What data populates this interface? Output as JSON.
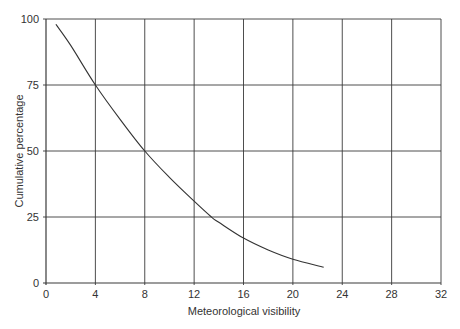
{
  "chart_data": {
    "type": "line",
    "title": "",
    "xlabel": "Meteorological visibility",
    "ylabel": "Cumulative percentage",
    "xlim": [
      0,
      32
    ],
    "ylim": [
      0,
      100
    ],
    "x_ticks": [
      0,
      4,
      8,
      12,
      16,
      20,
      24,
      28,
      32
    ],
    "y_ticks": [
      0,
      25,
      50,
      75,
      100
    ],
    "grid": true,
    "legend": null,
    "series": [
      {
        "name": "Cumulative percentage",
        "x": [
          0.8,
          2,
          4,
          6,
          8,
          10,
          12,
          13.4,
          14,
          16,
          18,
          20,
          22.5
        ],
        "y": [
          98,
          90,
          75,
          62,
          50,
          40,
          31,
          25,
          23,
          17,
          12.5,
          9,
          6
        ]
      }
    ]
  }
}
